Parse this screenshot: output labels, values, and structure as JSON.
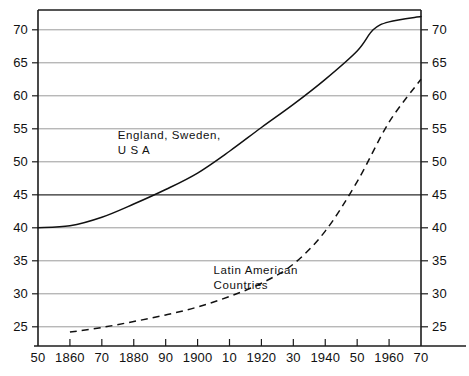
{
  "chart_data": {
    "type": "line",
    "title": "",
    "subtitle": "",
    "xlabel": "",
    "ylabel": "",
    "xlim": [
      1850,
      1970
    ],
    "ylim": [
      23,
      73
    ],
    "grid": true,
    "legend_position": "inline-annotations",
    "y_ticks": [
      25,
      30,
      35,
      40,
      45,
      50,
      55,
      60,
      65,
      70
    ],
    "y_tick_labels_left": [
      "25",
      "30",
      "35",
      "40",
      "45",
      "50",
      "55",
      "60",
      "65",
      "70"
    ],
    "y_tick_labels_right": [
      "25",
      "30",
      "35",
      "40",
      "45",
      "50",
      "55",
      "60",
      "65",
      "70"
    ],
    "y_emphasized_gridline": 45,
    "x_ticks": [
      1850,
      1860,
      1870,
      1880,
      1890,
      1900,
      1910,
      1920,
      1930,
      1940,
      1950,
      1960,
      1970
    ],
    "x_tick_labels": [
      "50",
      "1860",
      "70",
      "1880",
      "90",
      "1900",
      "10",
      "1920",
      "30",
      "1940",
      "50",
      "1960",
      "70"
    ],
    "series": [
      {
        "name": "England, Sweden, U S A",
        "style": "solid",
        "color": "#111111",
        "x": [
          1850,
          1860,
          1870,
          1880,
          1890,
          1900,
          1910,
          1920,
          1930,
          1940,
          1950,
          1955,
          1960,
          1970
        ],
        "values": [
          40.0,
          40.3,
          41.6,
          43.6,
          45.8,
          48.3,
          51.6,
          55.2,
          58.7,
          62.5,
          66.8,
          70.0,
          71.2,
          72.0
        ]
      },
      {
        "name": "Latin American Countries",
        "style": "dashed",
        "color": "#111111",
        "x": [
          1860,
          1870,
          1880,
          1890,
          1900,
          1910,
          1920,
          1930,
          1940,
          1950,
          1960,
          1970
        ],
        "values": [
          24.2,
          24.9,
          25.8,
          26.8,
          28.0,
          29.6,
          31.6,
          34.5,
          39.5,
          47.0,
          56.0,
          62.5
        ]
      }
    ],
    "annotations": [
      {
        "id": "annot-developed",
        "lines": [
          "England, Sweden,",
          "U S A"
        ],
        "x": 1875,
        "y": 53.5
      },
      {
        "id": "annot-latin",
        "lines": [
          "Latin American",
          "Countries"
        ],
        "x": 1905,
        "y": 33.0
      }
    ]
  }
}
